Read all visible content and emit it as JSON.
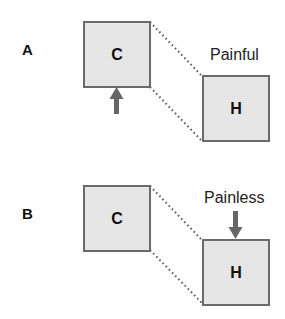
{
  "colors": {
    "box_fill": "#e6e6e6",
    "box_border": "#6a6a6a",
    "arrow": "#666666",
    "dotted_line": "#555555",
    "text": "#111111"
  },
  "panels": [
    {
      "label": "A",
      "left_box": {
        "letter": "C"
      },
      "right_box": {
        "letter": "H"
      },
      "caption": "Painful",
      "arrow": {
        "direction": "up",
        "target": "C"
      }
    },
    {
      "label": "B",
      "left_box": {
        "letter": "C"
      },
      "right_box": {
        "letter": "H"
      },
      "caption": "Painless",
      "arrow": {
        "direction": "down",
        "target": "H"
      }
    }
  ]
}
